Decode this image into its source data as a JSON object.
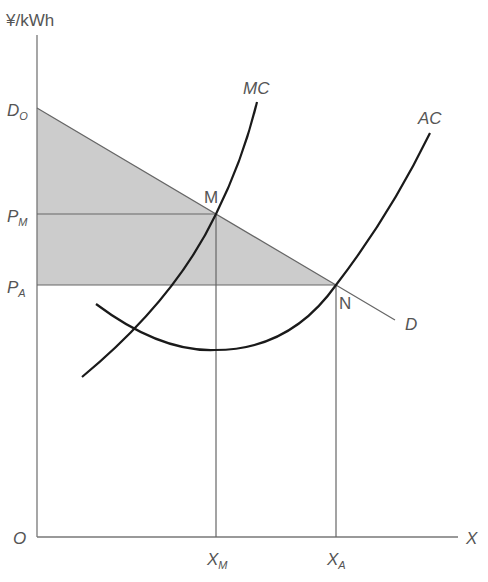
{
  "diagram": {
    "type": "economics-natural-monopoly-pricing",
    "y_axis_label": "¥/kWh",
    "x_axis_label": "X",
    "origin_label": "O",
    "price_labels": {
      "demand_intercept": {
        "main": "D",
        "sub": "O"
      },
      "marginal_cost_price": {
        "main": "P",
        "sub": "M"
      },
      "average_cost_price": {
        "main": "P",
        "sub": "A"
      }
    },
    "quantity_labels": {
      "marginal_cost_quantity": {
        "main": "X",
        "sub": "M"
      },
      "average_cost_quantity": {
        "main": "X",
        "sub": "A"
      }
    },
    "curves": {
      "marginal_cost": "MC",
      "average_cost": "AC",
      "demand": "D"
    },
    "points": {
      "mc_demand_intersection": "M",
      "ac_demand_intersection": "N"
    },
    "shaded_region": "consumer surplus area between D0 and PA under demand curve",
    "colors": {
      "curve": "#1a1a1a",
      "axis": "#777777",
      "guide": "#666666",
      "shade": "#cccccc",
      "label": "#555555"
    }
  }
}
